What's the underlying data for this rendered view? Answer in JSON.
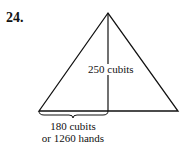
{
  "problem": {
    "number": "24."
  },
  "diagram": {
    "shape": "triangle",
    "stroke_color": "#111111",
    "height_label": "250 cubits",
    "base_half_label_line1": "180 cubits",
    "base_half_label_line2": "or 1260 hands"
  }
}
